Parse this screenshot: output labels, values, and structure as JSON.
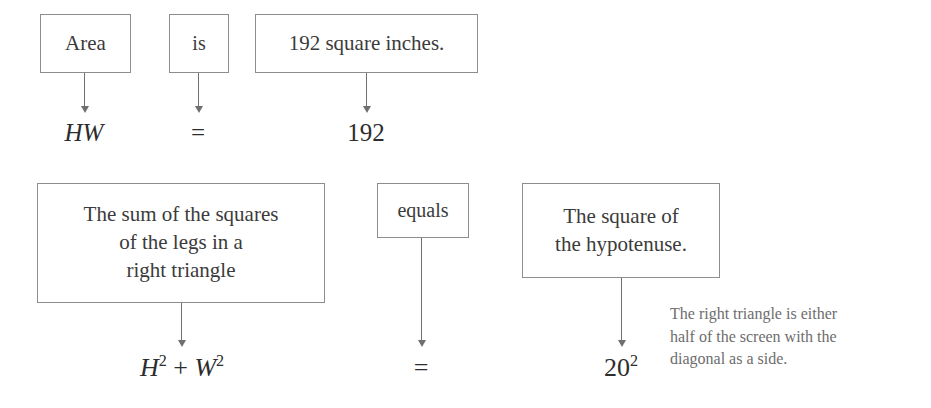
{
  "diagram": {
    "equations": [
      {
        "id": "area-equation",
        "phrases": [
          {
            "id": "area",
            "text": "Area"
          },
          {
            "id": "is",
            "text": "is"
          },
          {
            "id": "value",
            "text": "192 square inches."
          }
        ],
        "symbols": [
          {
            "id": "hw",
            "text": "HW"
          },
          {
            "id": "equals-sign",
            "text": "="
          },
          {
            "id": "one-ninety-two",
            "text": "192"
          }
        ]
      },
      {
        "id": "pythagorean-equation",
        "phrases": [
          {
            "id": "sum-of-squares",
            "text": "The sum of the squares\nof the legs in a\nright triangle"
          },
          {
            "id": "equals",
            "text": "equals"
          },
          {
            "id": "square-of-hypotenuse",
            "text": "The square of\nthe hypotenuse."
          }
        ],
        "symbols": [
          {
            "id": "h2-plus-w2",
            "base1": "H",
            "exp1": "2",
            "operator": " + ",
            "base2": "W",
            "exp2": "2"
          },
          {
            "id": "equals-sign",
            "text": "="
          },
          {
            "id": "twenty-squared",
            "base": "20",
            "exp": "2"
          }
        ]
      }
    ],
    "note": {
      "id": "right-triangle-note",
      "text": "The right triangle is either\nhalf of the screen with the\ndiagonal as a side."
    },
    "colors": {
      "box_border": "#8d8d8d",
      "text": "#3b3b3b",
      "arrow": "#6f6f6f",
      "note_text": "#6d6d6d",
      "background": "#ffffff"
    }
  }
}
